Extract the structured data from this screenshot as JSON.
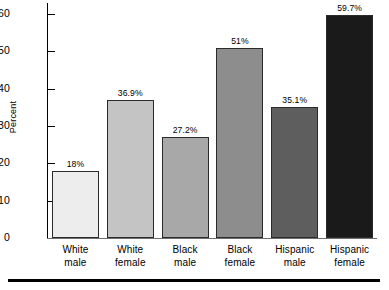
{
  "chart_data": {
    "type": "bar",
    "title": "",
    "xlabel": "",
    "ylabel": "Percent",
    "ylim": [
      0,
      63
    ],
    "yticks": [
      0,
      10,
      20,
      30,
      40,
      50,
      60
    ],
    "ytick_labels": [
      "0",
      "10",
      "20",
      "30",
      "40",
      "50",
      "60"
    ],
    "grid": false,
    "legend": "none",
    "categories": [
      "White male",
      "White female",
      "Black male",
      "Black female",
      "Hispanic male",
      "Hispanic female"
    ],
    "category_lines": [
      {
        "line1": "White",
        "line2": "male"
      },
      {
        "line1": "White",
        "line2": "female"
      },
      {
        "line1": "Black",
        "line2": "male"
      },
      {
        "line1": "Black",
        "line2": "female"
      },
      {
        "line1": "Hispanic",
        "line2": "male"
      },
      {
        "line1": "Hispanic",
        "line2": "female"
      }
    ],
    "values": [
      18,
      36.9,
      27.2,
      51,
      35.1,
      59.7
    ],
    "value_labels": [
      "18%",
      "36.9%",
      "27.2%",
      "51%",
      "35.1%",
      "59.7%"
    ],
    "bar_colors": [
      "#ededed",
      "#c4c4c4",
      "#a8a8a8",
      "#8d8d8d",
      "#5e5e5e",
      "#1a1a1a"
    ],
    "bar_edge_color": "#2b2b2b"
  }
}
